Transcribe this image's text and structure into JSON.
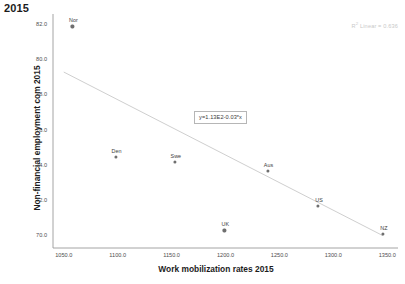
{
  "chart_data": {
    "type": "scatter",
    "title": "2015",
    "xlabel": "Work mobilization rates 2015",
    "ylabel": "Non-financial employment com 2015",
    "xlim": [
      1040,
      1360
    ],
    "ylim": [
      69.3,
      82.6
    ],
    "xticks": [
      "1050.0",
      "1100.0",
      "1150.0",
      "1200.0",
      "1250.0",
      "1300.0",
      "1350.0"
    ],
    "xtick_values": [
      1050,
      1100,
      1150,
      1200,
      1250,
      1300,
      1350
    ],
    "yticks": [
      "70.0",
      "72.0",
      "74.0",
      "76.0",
      "78.0",
      "80.0",
      "82.0"
    ],
    "ytick_values": [
      70,
      72,
      74,
      76,
      78,
      80,
      82
    ],
    "grid": false,
    "legend_position": "top-right",
    "points": [
      {
        "label": "Nor",
        "x": 1058,
        "y": 81.9
      },
      {
        "label": "Den",
        "x": 1098,
        "y": 74.5
      },
      {
        "label": "Swe",
        "x": 1153,
        "y": 74.2
      },
      {
        "label": "UK",
        "x": 1199,
        "y": 70.3
      },
      {
        "label": "Aus",
        "x": 1239,
        "y": 73.7
      },
      {
        "label": "US",
        "x": 1286,
        "y": 71.7
      },
      {
        "label": "NZ",
        "x": 1346,
        "y": 70.1
      }
    ],
    "fit_line": {
      "equation_label": "y=1.13E2-0.03*x",
      "intercept": 113.0,
      "slope": -0.03,
      "x_start": 1050,
      "x_end": 1346,
      "y_start": 79.3,
      "y_end": 70.0
    },
    "r_squared_label": "R Linear = 0.636",
    "r_squared_sup": "2",
    "r_squared_value": 0.636
  }
}
